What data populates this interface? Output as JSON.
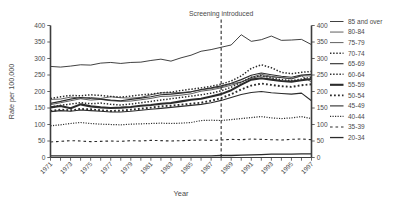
{
  "chart_data": {
    "type": "line",
    "title": "",
    "xlabel": "Year",
    "ylabel": "Rate per 100,000",
    "xlim": [
      1971,
      1997
    ],
    "ylim": [
      0,
      400
    ],
    "ytick_values": [
      0,
      50,
      100,
      150,
      200,
      250,
      300,
      350,
      400
    ],
    "ytick_labels": [
      "0",
      "50",
      "100",
      "150",
      "200",
      "250",
      "300",
      "350",
      "400"
    ],
    "ytick_labels_right": [
      "0",
      "50",
      "100",
      "150",
      "200",
      "250",
      "300",
      "350",
      "400"
    ],
    "x": [
      1971,
      1972,
      1973,
      1974,
      1975,
      1976,
      1977,
      1978,
      1979,
      1980,
      1981,
      1982,
      1983,
      1984,
      1985,
      1986,
      1987,
      1988,
      1989,
      1990,
      1991,
      1992,
      1993,
      1994,
      1995,
      1996,
      1997
    ],
    "xtick_values": [
      1971,
      1972,
      1973,
      1974,
      1975,
      1976,
      1977,
      1978,
      1979,
      1980,
      1981,
      1982,
      1983,
      1984,
      1985,
      1986,
      1987,
      1988,
      1989,
      1990,
      1991,
      1992,
      1993,
      1994,
      1995,
      1996,
      1997
    ],
    "xtick_labels": [
      "1971",
      "",
      "1973",
      "",
      "1975",
      "",
      "1977",
      "",
      "1979",
      "",
      "1981",
      "",
      "1983",
      "",
      "1985",
      "",
      "1987",
      "",
      "1989",
      "",
      "1991",
      "",
      "1993",
      "",
      "1995",
      "",
      "1997"
    ],
    "grid": false,
    "legend_position": "right",
    "annotations": [
      {
        "text": "Screening introduced",
        "x": 1988,
        "kind": "vertical-dashed-line"
      }
    ],
    "series": [
      {
        "name": "85 and over",
        "style": "solid",
        "width": 0.9,
        "values": [
          276,
          274,
          277,
          281,
          280,
          286,
          288,
          285,
          288,
          289,
          294,
          298,
          292,
          302,
          310,
          322,
          327,
          334,
          341,
          372,
          352,
          357,
          368,
          355,
          356,
          358,
          342
        ]
      },
      {
        "name": "80-84",
        "style": "solid",
        "width": 0.75,
        "values": [
          176,
          177,
          183,
          180,
          182,
          179,
          184,
          181,
          180,
          182,
          190,
          196,
          196,
          197,
          199,
          205,
          209,
          214,
          223,
          229,
          240,
          247,
          244,
          242,
          238,
          247,
          229
        ]
      },
      {
        "name": "75-79",
        "style": "solid",
        "width": 0.75,
        "values": [
          160,
          166,
          172,
          178,
          174,
          176,
          172,
          170,
          171,
          175,
          179,
          185,
          186,
          189,
          193,
          201,
          205,
          211,
          219,
          228,
          243,
          252,
          246,
          242,
          239,
          248,
          247
        ]
      },
      {
        "name": "70-74",
        "style": "dotted",
        "width": 1.5,
        "values": [
          179,
          184,
          188,
          187,
          190,
          188,
          185,
          183,
          186,
          190,
          192,
          196,
          198,
          203,
          207,
          211,
          216,
          222,
          232,
          247,
          270,
          281,
          272,
          258,
          254,
          258,
          261
        ]
      },
      {
        "name": "65-69",
        "style": "solid",
        "width": 1.1,
        "values": [
          164,
          170,
          177,
          182,
          179,
          177,
          174,
          172,
          176,
          180,
          184,
          190,
          192,
          195,
          199,
          206,
          211,
          217,
          225,
          236,
          249,
          256,
          251,
          246,
          243,
          250,
          252
        ]
      },
      {
        "name": "60-64",
        "style": "dotted",
        "width": 1.5,
        "values": [
          153,
          158,
          162,
          166,
          163,
          165,
          161,
          159,
          162,
          166,
          170,
          174,
          178,
          182,
          186,
          190,
          195,
          202,
          213,
          228,
          243,
          248,
          241,
          236,
          233,
          238,
          243
        ]
      },
      {
        "name": "55-59",
        "style": "solid",
        "width": 2.1,
        "values": [
          152,
          156,
          149,
          161,
          155,
          152,
          150,
          151,
          153,
          157,
          159,
          163,
          165,
          170,
          175,
          178,
          185,
          192,
          204,
          221,
          236,
          240,
          236,
          232,
          230,
          234,
          238
        ]
      },
      {
        "name": "50-54",
        "style": "dotted",
        "width": 1.9,
        "values": [
          141,
          145,
          143,
          147,
          146,
          143,
          141,
          142,
          145,
          148,
          151,
          155,
          157,
          160,
          163,
          166,
          172,
          180,
          192,
          206,
          218,
          224,
          220,
          216,
          214,
          219,
          222
        ]
      },
      {
        "name": "45-49",
        "style": "solid",
        "width": 1.1,
        "values": [
          139,
          142,
          140,
          144,
          142,
          140,
          138,
          138,
          140,
          143,
          146,
          149,
          152,
          155,
          158,
          161,
          166,
          173,
          182,
          191,
          197,
          200,
          196,
          194,
          192,
          195,
          172
        ]
      },
      {
        "name": "40-44",
        "style": "dotted",
        "width": 1.2,
        "values": [
          96,
          99,
          103,
          106,
          103,
          101,
          100,
          99,
          101,
          102,
          103,
          104,
          103,
          104,
          106,
          112,
          113,
          112,
          115,
          118,
          121,
          124,
          120,
          118,
          120,
          124,
          118
        ]
      },
      {
        "name": "35-39",
        "style": "dashed",
        "width": 1.1,
        "values": [
          47,
          49,
          51,
          50,
          48,
          49,
          50,
          49,
          51,
          50,
          52,
          51,
          50,
          51,
          52,
          53,
          52,
          53,
          55,
          54,
          56,
          55,
          54,
          53,
          55,
          56,
          54
        ]
      },
      {
        "name": "20-34",
        "style": "solid",
        "width": 1.3,
        "values": [
          5,
          5,
          5,
          5,
          5,
          5,
          5,
          5,
          5,
          5,
          5,
          5,
          5,
          5,
          5,
          5,
          5,
          6,
          6,
          7,
          8,
          9,
          10,
          10,
          10,
          11,
          11
        ]
      }
    ]
  },
  "legend": {
    "items": [
      {
        "label": "85 and over"
      },
      {
        "label": "80-84"
      },
      {
        "label": "75-79"
      },
      {
        "label": "70-74"
      },
      {
        "label": "65-69"
      },
      {
        "label": "60-64"
      },
      {
        "label": "55-59"
      },
      {
        "label": "50-54"
      },
      {
        "label": "45-49"
      },
      {
        "label": "40-44"
      },
      {
        "label": "35-39"
      },
      {
        "label": "20-34"
      }
    ]
  }
}
